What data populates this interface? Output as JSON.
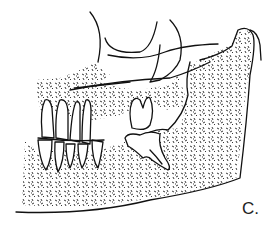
{
  "figure": {
    "panel_label": "C.",
    "line_color": "#111111",
    "background_color": "#ffffff"
  }
}
